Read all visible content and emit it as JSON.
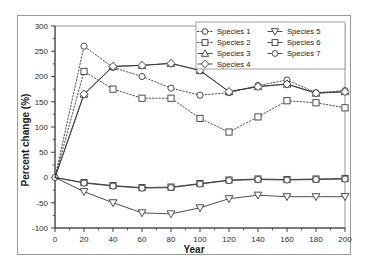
{
  "chart_data": {
    "type": "line",
    "title": "",
    "xlabel": "Year",
    "ylabel": "Percent change (%)",
    "xlim": [
      0,
      200
    ],
    "ylim": [
      -100,
      300
    ],
    "xticks": [
      0,
      20,
      40,
      60,
      80,
      100,
      120,
      140,
      160,
      180,
      200
    ],
    "yticks": [
      -100,
      -50,
      0,
      50,
      100,
      150,
      200,
      250,
      300
    ],
    "xticklabels": [
      "0",
      "20",
      "40",
      "60",
      "80",
      "100",
      "120",
      "140",
      "160",
      "180",
      "200"
    ],
    "yticklabels": [
      "-100",
      "-50",
      "0",
      "50",
      "100",
      "150",
      "200",
      "250",
      "300"
    ],
    "grid": false,
    "legend_position": "upper right",
    "legend_columns": 2,
    "x": [
      0,
      20,
      40,
      60,
      80,
      100,
      120,
      140,
      160,
      180,
      200
    ],
    "series": [
      {
        "name": "Species 1",
        "marker": "circle",
        "linestyle": "dotted",
        "values": [
          0,
          260,
          218,
          200,
          177,
          163,
          168,
          182,
          193,
          168,
          172
        ]
      },
      {
        "name": "Species 2",
        "marker": "square",
        "linestyle": "dotted",
        "values": [
          0,
          210,
          175,
          157,
          157,
          117,
          90,
          120,
          152,
          148,
          138
        ]
      },
      {
        "name": "Species 3",
        "marker": "triangle-up",
        "linestyle": "solid",
        "values": [
          0,
          165,
          220,
          222,
          226,
          212,
          170,
          180,
          185,
          167,
          170
        ]
      },
      {
        "name": "Species 4",
        "marker": "diamond",
        "linestyle": "solid",
        "values": [
          0,
          165,
          220,
          222,
          226,
          212,
          170,
          180,
          185,
          167,
          170
        ]
      },
      {
        "name": "Species 5",
        "marker": "triangle-down",
        "linestyle": "solid",
        "values": [
          0,
          -28,
          -50,
          -70,
          -72,
          -60,
          -42,
          -35,
          -38,
          -38,
          -38
        ]
      },
      {
        "name": "Species 6",
        "marker": "square",
        "linestyle": "solid",
        "values": [
          0,
          -10,
          -16,
          -20,
          -19,
          -12,
          -5,
          -3,
          -4,
          -3,
          -2
        ]
      },
      {
        "name": "Species 7",
        "marker": "circle",
        "linestyle": "solid",
        "values": [
          0,
          -11,
          -17,
          -21,
          -20,
          -13,
          -6,
          -4,
          -5,
          -4,
          -3
        ]
      }
    ]
  },
  "legend": {
    "items": [
      {
        "label": "Species 1"
      },
      {
        "label": "Species 2"
      },
      {
        "label": "Species 3"
      },
      {
        "label": "Species 4"
      },
      {
        "label": "Species 5"
      },
      {
        "label": "Species 6"
      },
      {
        "label": "Species 7"
      }
    ]
  },
  "axes": {
    "x_title": "Year",
    "y_title": "Percent change (%)"
  }
}
